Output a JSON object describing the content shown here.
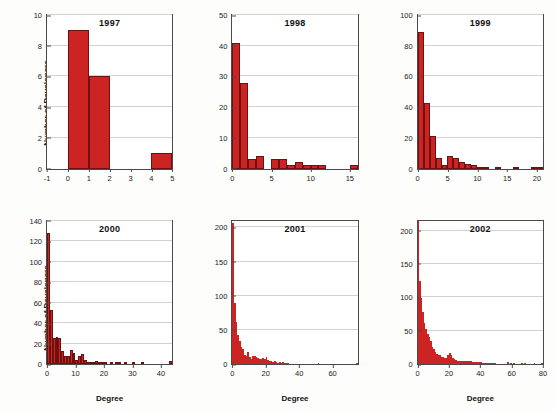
{
  "figure": {
    "ylabel": "Number of Developers",
    "xlabel": "Degree",
    "bar_color": "#cc2423",
    "bar_edge_color": "#6d1210",
    "grid_color": "#d2d2d2",
    "axis_color": "#4a4a4a"
  },
  "chart_data": [
    {
      "type": "bar",
      "title": "1997",
      "xlabel": "",
      "ylabel": "Number of Developers",
      "xlim": [
        -1,
        5
      ],
      "ylim": [
        0,
        10
      ],
      "xticks": [
        -1,
        0,
        1,
        2,
        3,
        4,
        5
      ],
      "yticks": [
        0,
        2,
        4,
        6,
        8,
        10
      ],
      "grid": true,
      "bin_width": 1,
      "x": [
        0,
        1,
        4
      ],
      "values": [
        9,
        6,
        1
      ]
    },
    {
      "type": "bar",
      "title": "1998",
      "xlabel": "",
      "ylabel": "",
      "xlim": [
        0,
        16
      ],
      "ylim": [
        0,
        50
      ],
      "xticks": [
        0,
        5,
        10,
        15
      ],
      "yticks": [
        0,
        10,
        20,
        30,
        40,
        50
      ],
      "grid": true,
      "bin_width": 1,
      "x": [
        0,
        1,
        2,
        3,
        5,
        6,
        7,
        8,
        9,
        10,
        11,
        15
      ],
      "values": [
        41,
        28,
        3,
        4,
        3,
        3,
        1,
        2,
        1,
        1,
        1,
        1
      ]
    },
    {
      "type": "bar",
      "title": "1999",
      "xlabel": "",
      "ylabel": "",
      "xlim": [
        0,
        21
      ],
      "ylim": [
        0,
        100
      ],
      "xticks": [
        0,
        5,
        10,
        15,
        20
      ],
      "yticks": [
        0,
        20,
        40,
        60,
        80,
        100
      ],
      "grid": true,
      "bin_width": 1,
      "x": [
        0,
        1,
        2,
        3,
        4,
        5,
        6,
        7,
        8,
        9,
        10,
        11,
        13,
        16,
        19,
        20
      ],
      "values": [
        89,
        43,
        21,
        7,
        2,
        8,
        7,
        4,
        3,
        2,
        1,
        1,
        1,
        1,
        1,
        1
      ]
    },
    {
      "type": "bar",
      "title": "2000",
      "xlabel": "Degree",
      "ylabel": "Number of Developers",
      "xlim": [
        0,
        44
      ],
      "ylim": [
        0,
        140
      ],
      "xticks": [
        0,
        10,
        20,
        30,
        40
      ],
      "yticks": [
        0,
        20,
        40,
        60,
        80,
        100,
        120,
        140
      ],
      "grid": true,
      "bin_width": 1,
      "x": [
        0,
        1,
        2,
        3,
        4,
        5,
        6,
        7,
        8,
        9,
        10,
        11,
        12,
        13,
        14,
        15,
        16,
        17,
        18,
        19,
        20,
        22,
        24,
        25,
        27,
        30,
        33,
        43
      ],
      "values": [
        128,
        53,
        25,
        26,
        25,
        13,
        8,
        8,
        14,
        11,
        4,
        8,
        10,
        4,
        2,
        1,
        1,
        3,
        2,
        1,
        1,
        1,
        2,
        2,
        1,
        2,
        1,
        3
      ]
    },
    {
      "type": "bar",
      "title": "2001",
      "xlabel": "Degree",
      "ylabel": "",
      "xlim": [
        0,
        75
      ],
      "ylim": [
        0,
        210
      ],
      "xticks": [
        0,
        20,
        40,
        60
      ],
      "yticks": [
        0,
        50,
        100,
        150,
        200
      ],
      "grid": true,
      "bin_width": 1,
      "x": [
        0,
        1,
        2,
        3,
        4,
        5,
        6,
        7,
        8,
        9,
        10,
        11,
        12,
        13,
        14,
        15,
        16,
        17,
        18,
        19,
        20,
        21,
        22,
        23,
        24,
        25,
        26,
        27,
        28,
        29,
        30,
        31,
        32,
        33,
        51,
        74
      ],
      "values": [
        207,
        90,
        61,
        43,
        33,
        25,
        22,
        13,
        11,
        17,
        10,
        8,
        12,
        11,
        10,
        9,
        8,
        7,
        9,
        8,
        10,
        6,
        4,
        4,
        3,
        4,
        3,
        2,
        3,
        2,
        3,
        2,
        1,
        1,
        1,
        1
      ]
    },
    {
      "type": "bar",
      "title": "2002",
      "xlabel": "Degree",
      "ylabel": "",
      "xlim": [
        0,
        80
      ],
      "ylim": [
        0,
        215
      ],
      "xticks": [
        0,
        20,
        40,
        60,
        80
      ],
      "yticks": [
        0,
        50,
        100,
        150,
        200
      ],
      "grid": true,
      "bin_width": 1,
      "x": [
        0,
        1,
        2,
        3,
        4,
        5,
        6,
        7,
        8,
        9,
        10,
        11,
        12,
        13,
        14,
        15,
        16,
        17,
        18,
        19,
        20,
        21,
        22,
        23,
        24,
        25,
        26,
        27,
        28,
        29,
        30,
        31,
        32,
        33,
        34,
        35,
        36,
        37,
        38,
        39,
        40,
        41,
        42,
        43,
        44,
        45,
        46,
        47,
        48,
        49,
        57,
        59,
        61,
        66,
        68,
        74,
        79
      ],
      "values": [
        215,
        124,
        99,
        78,
        62,
        53,
        45,
        40,
        34,
        26,
        22,
        18,
        15,
        14,
        13,
        11,
        10,
        9,
        9,
        13,
        17,
        13,
        9,
        7,
        6,
        5,
        5,
        4,
        4,
        4,
        5,
        4,
        4,
        4,
        4,
        3,
        3,
        3,
        3,
        3,
        3,
        2,
        2,
        2,
        2,
        2,
        2,
        2,
        2,
        2,
        3,
        2,
        2,
        2,
        2,
        2,
        2
      ]
    }
  ]
}
